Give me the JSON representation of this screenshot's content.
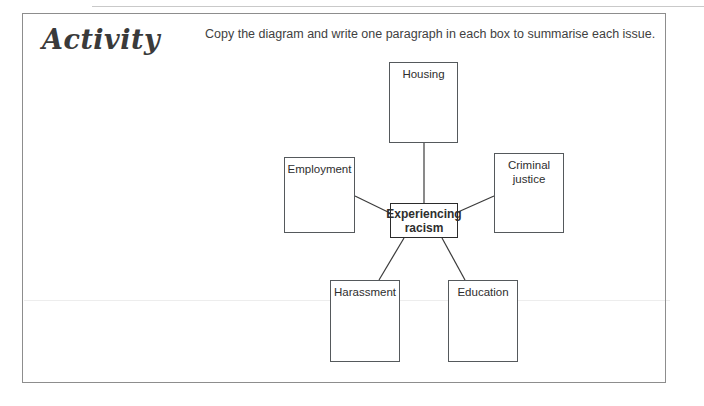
{
  "page": {
    "title": "Activity",
    "instruction": "Copy the diagram and write one paragraph in each box to summarise each issue."
  },
  "diagram": {
    "center": {
      "label": "Experiencing racism",
      "line1": "Experiencing",
      "line2": "racism"
    },
    "nodes": [
      {
        "id": "housing",
        "label": "Housing"
      },
      {
        "id": "employment",
        "label": "Employment"
      },
      {
        "id": "criminal-justice",
        "label": "Criminal justice",
        "line1": "Criminal",
        "line2": "justice"
      },
      {
        "id": "harassment",
        "label": "Harassment"
      },
      {
        "id": "education",
        "label": "Education"
      }
    ],
    "colors": {
      "box_border": "#55595c",
      "center_border": "#2b2b2b",
      "connector": "#3b3b3b",
      "frame": "#8d8d8d"
    }
  }
}
